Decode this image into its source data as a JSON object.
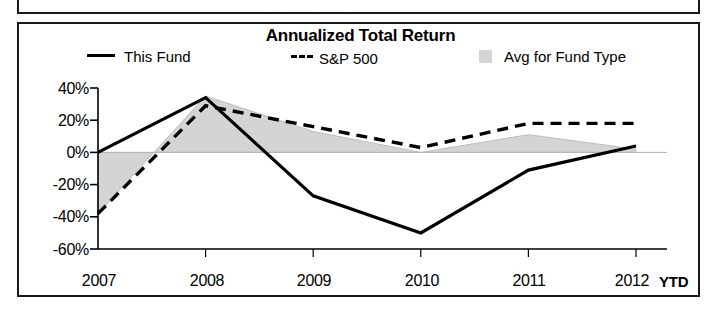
{
  "panel": {
    "title": "Annualized Total Return"
  },
  "legend": [
    {
      "label": "This Fund",
      "marker": "solid-line-swatch",
      "color": "#000000"
    },
    {
      "label": "S&P 500",
      "marker": "dashed-line-swatch",
      "color": "#000000"
    },
    {
      "label": "Avg for Fund Type",
      "marker": "filled-area-swatch",
      "color": "#d4d4d4"
    }
  ],
  "axis": {
    "ytd_note": "YTD",
    "y_ticks": [
      "40%",
      "20%",
      "0%",
      "-20%",
      "-40%",
      "-60%"
    ],
    "x_ticks": [
      "2007",
      "2008",
      "2009",
      "2010",
      "2011",
      "2012"
    ]
  },
  "chart_data": {
    "type": "line",
    "title": "Annualized Total Return",
    "xlabel": "",
    "ylabel": "",
    "categories": [
      "2007",
      "2008",
      "2009",
      "2010",
      "2011",
      "2012"
    ],
    "x_tick_labels": [
      "2007",
      "2008",
      "2009",
      "2010",
      "2011",
      "2012"
    ],
    "y_tick_labels": [
      "40%",
      "20%",
      "0%",
      "-20%",
      "-40%",
      "-60%"
    ],
    "y_ticks": [
      40,
      20,
      0,
      -20,
      -40,
      -60
    ],
    "ylim": [
      -60,
      40
    ],
    "grid": false,
    "legend_position": "top",
    "annotations": [
      "YTD"
    ],
    "series": [
      {
        "name": "This Fund",
        "style": "solid",
        "color": "#000000",
        "values": [
          0,
          34,
          -27,
          -50,
          -11,
          4
        ]
      },
      {
        "name": "S&P 500",
        "style": "dashed",
        "color": "#000000",
        "values": [
          -38,
          29,
          16,
          3,
          18,
          18
        ]
      },
      {
        "name": "Avg for Fund Type",
        "style": "filled-area",
        "color": "#d4d4d4",
        "values": [
          -38,
          35,
          13,
          0,
          11,
          2
        ]
      }
    ]
  }
}
